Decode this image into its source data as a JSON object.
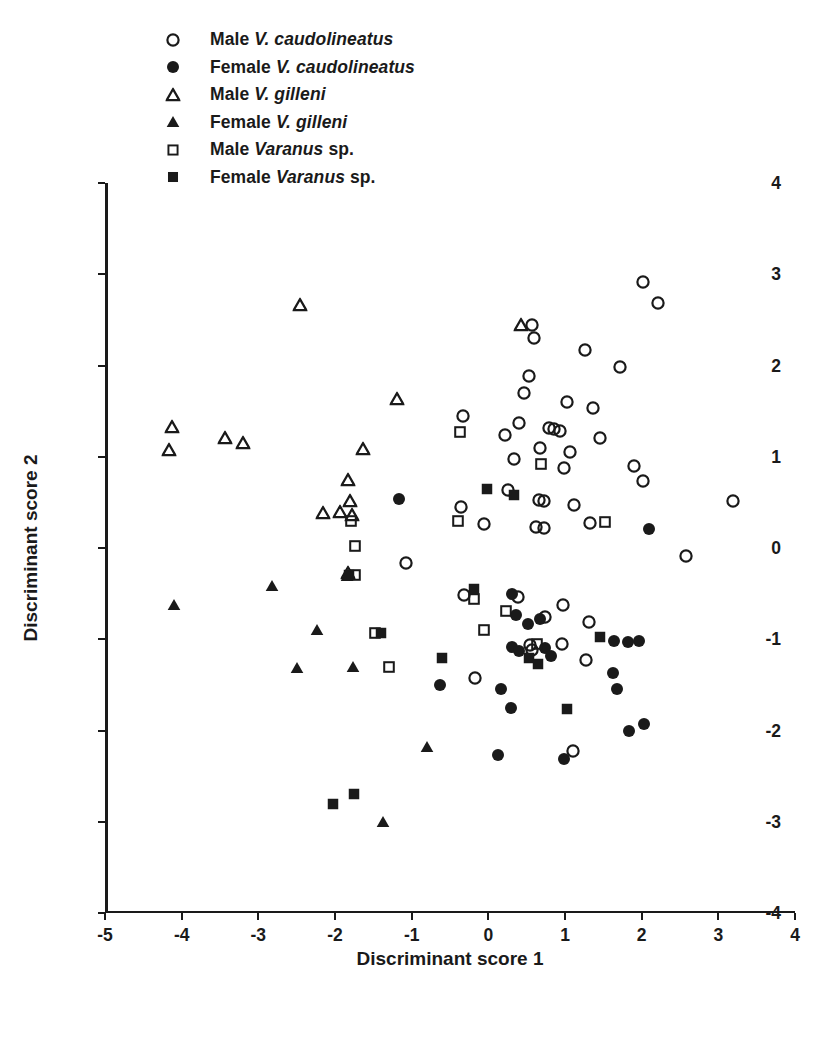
{
  "chart_data": {
    "type": "scatter",
    "title": "",
    "xlabel": "Discriminant score 1",
    "ylabel": "Discriminant score 2",
    "xlim": [
      -5,
      4
    ],
    "ylim": [
      -4,
      4
    ],
    "xticks": [
      "-5",
      "-4",
      "-3",
      "-2",
      "-1",
      "0",
      "1",
      "2",
      "3",
      "4"
    ],
    "yticks": [
      "4",
      "3",
      "2",
      "1",
      "0",
      "-1",
      "-2",
      "-3",
      "-4"
    ],
    "grid": false,
    "legend_position": "top-left-outside",
    "marker_color": "#1a1a1a",
    "series": [
      {
        "name": "Male V. caudolineatus",
        "legend_prefix": "Male",
        "legend_italic": "V. caudolineatus",
        "legend_suffix": "",
        "marker": "circle-open",
        "points": [
          [
            2.02,
            2.91
          ],
          [
            2.21,
            2.68
          ],
          [
            0.57,
            2.44
          ],
          [
            0.6,
            2.3
          ],
          [
            1.26,
            2.17
          ],
          [
            1.72,
            1.98
          ],
          [
            0.53,
            1.89
          ],
          [
            0.46,
            1.7
          ],
          [
            1.02,
            1.6
          ],
          [
            1.36,
            1.53
          ],
          [
            -0.33,
            1.45
          ],
          [
            0.4,
            1.37
          ],
          [
            0.79,
            1.32
          ],
          [
            0.86,
            1.3
          ],
          [
            0.94,
            1.28
          ],
          [
            0.22,
            1.24
          ],
          [
            1.45,
            1.21
          ],
          [
            0.68,
            1.1
          ],
          [
            0.33,
            0.97
          ],
          [
            1.07,
            1.05
          ],
          [
            0.99,
            0.88
          ],
          [
            1.9,
            0.9
          ],
          [
            2.02,
            0.73
          ],
          [
            -0.36,
            0.45
          ],
          [
            0.25,
            0.64
          ],
          [
            0.73,
            0.52
          ],
          [
            0.66,
            0.53
          ],
          [
            1.12,
            0.47
          ],
          [
            -0.06,
            0.26
          ],
          [
            0.62,
            0.23
          ],
          [
            0.72,
            0.22
          ],
          [
            1.33,
            0.27
          ],
          [
            2.58,
            -0.09
          ],
          [
            3.19,
            0.51
          ],
          [
            -1.07,
            -0.16
          ],
          [
            -0.32,
            -0.51
          ],
          [
            0.39,
            -0.54
          ],
          [
            0.97,
            -0.62
          ],
          [
            0.74,
            -0.76
          ],
          [
            1.31,
            -0.81
          ],
          [
            0.96,
            -1.05
          ],
          [
            1.28,
            -1.23
          ],
          [
            -0.17,
            -1.43
          ],
          [
            0.57,
            -1.12
          ],
          [
            1.1,
            -2.22
          ],
          [
            0.54,
            -1.06
          ]
        ]
      },
      {
        "name": "Female V. caudolineatus",
        "legend_prefix": "Female",
        "legend_italic": "V. caudolineatus",
        "legend_suffix": "",
        "marker": "circle-filled",
        "points": [
          [
            -1.16,
            0.54
          ],
          [
            2.09,
            0.21
          ],
          [
            0.31,
            -0.5
          ],
          [
            0.36,
            -0.73
          ],
          [
            0.68,
            -0.78
          ],
          [
            0.31,
            -1.08
          ],
          [
            0.4,
            -1.13
          ],
          [
            0.74,
            -1.1
          ],
          [
            0.82,
            -1.18
          ],
          [
            1.64,
            -1.02
          ],
          [
            1.82,
            -1.03
          ],
          [
            1.96,
            -1.02
          ],
          [
            1.62,
            -1.37
          ],
          [
            1.68,
            -1.54
          ],
          [
            -0.63,
            -1.5
          ],
          [
            0.17,
            -1.54
          ],
          [
            0.3,
            -1.75
          ],
          [
            1.84,
            -2.0
          ],
          [
            2.03,
            -1.93
          ],
          [
            0.12,
            -2.27
          ],
          [
            0.99,
            -2.31
          ],
          [
            0.52,
            -0.83
          ]
        ]
      },
      {
        "name": "Male V. gilleni",
        "legend_prefix": "Male",
        "legend_italic": "V. gilleni",
        "legend_suffix": "",
        "marker": "triangle-open",
        "points": [
          [
            -2.46,
            2.66
          ],
          [
            -1.19,
            1.63
          ],
          [
            0.42,
            2.44
          ],
          [
            -1.63,
            1.09
          ],
          [
            -4.13,
            1.33
          ],
          [
            -4.17,
            1.07
          ],
          [
            -3.44,
            1.21
          ],
          [
            -3.2,
            1.15
          ],
          [
            -1.83,
            0.74
          ],
          [
            -1.93,
            0.4
          ],
          [
            -1.78,
            0.36
          ],
          [
            -1.8,
            0.52
          ],
          [
            -2.16,
            0.38
          ],
          [
            -1.83,
            -0.27
          ]
        ]
      },
      {
        "name": "Female V. gilleni",
        "legend_prefix": "Female",
        "legend_italic": "V. gilleni",
        "legend_suffix": "",
        "marker": "triangle-filled",
        "points": [
          [
            -4.1,
            -0.62
          ],
          [
            -2.82,
            -0.42
          ],
          [
            -2.23,
            -0.9
          ],
          [
            -2.49,
            -1.31
          ],
          [
            -1.85,
            -0.31
          ],
          [
            -1.76,
            -1.3
          ],
          [
            -0.8,
            -2.18
          ],
          [
            -1.37,
            -3.0
          ]
        ]
      },
      {
        "name": "Male Varanus sp.",
        "legend_prefix": "Male",
        "legend_italic": "Varanus",
        "legend_suffix": "sp.",
        "marker": "square-open",
        "points": [
          [
            -0.37,
            1.27
          ],
          [
            0.69,
            0.92
          ],
          [
            -0.4,
            0.3
          ],
          [
            1.52,
            0.29
          ],
          [
            -1.74,
            0.02
          ],
          [
            -1.74,
            -0.3
          ],
          [
            -0.19,
            -0.56
          ],
          [
            -1.48,
            -0.93
          ],
          [
            -1.29,
            -1.3
          ],
          [
            -0.06,
            -0.9
          ],
          [
            0.63,
            -1.05
          ],
          [
            0.23,
            -0.69
          ],
          [
            -1.79,
            0.3
          ]
        ]
      },
      {
        "name": "Female Varanus sp.",
        "legend_prefix": "Female",
        "legend_italic": "Varanus",
        "legend_suffix": "sp.",
        "marker": "square-filled",
        "points": [
          [
            -0.02,
            0.65
          ],
          [
            0.33,
            0.58
          ],
          [
            -0.19,
            -0.45
          ],
          [
            -1.4,
            -0.93
          ],
          [
            -0.61,
            -1.2
          ],
          [
            0.53,
            -1.21
          ],
          [
            0.65,
            -1.27
          ],
          [
            1.46,
            -0.97
          ],
          [
            1.03,
            -1.76
          ],
          [
            -2.03,
            -2.8
          ],
          [
            -1.75,
            -2.7
          ],
          [
            -1.82,
            -0.3
          ]
        ]
      }
    ]
  }
}
